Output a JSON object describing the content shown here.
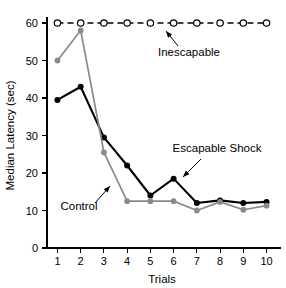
{
  "chart_data": {
    "type": "line",
    "title": "",
    "xlabel": "Trials",
    "ylabel": "Median Latency (sec)",
    "x": [
      1,
      2,
      3,
      4,
      5,
      6,
      7,
      8,
      9,
      10
    ],
    "xticklabels": [
      "1",
      "2",
      "3",
      "4",
      "5",
      "6",
      "7",
      "8",
      "9",
      "10"
    ],
    "yticklabels": [
      "0",
      "10",
      "20",
      "30",
      "40",
      "50",
      "60"
    ],
    "yticks": [
      0,
      10,
      20,
      30,
      40,
      50,
      60
    ],
    "xlim": [
      0.55,
      10.45
    ],
    "ylim": [
      0,
      63
    ],
    "grid": false,
    "legend": "inline-annotations",
    "series": [
      {
        "name": "Inescapable",
        "values": [
          60,
          60,
          60,
          60,
          60,
          60,
          60,
          60,
          60,
          60
        ],
        "color": "#000000",
        "linestyle": "dashed",
        "marker": "open-circle"
      },
      {
        "name": "Escapable Shock",
        "values": [
          39.5,
          43,
          29.5,
          22,
          14,
          18.5,
          12,
          12.7,
          12,
          12.3
        ],
        "color": "#000000",
        "linestyle": "solid",
        "marker": "filled-circle"
      },
      {
        "name": "Control",
        "values": [
          50,
          58,
          25.5,
          12.5,
          12.5,
          12.5,
          10,
          12.3,
          10.2,
          11.3
        ],
        "color": "#8a8a8a",
        "linestyle": "solid",
        "marker": "filled-circle"
      }
    ],
    "annotations": [
      {
        "text": "Inescapable",
        "target_series": "Inescapable"
      },
      {
        "text": "Escapable Shock",
        "target_series": "Escapable Shock"
      },
      {
        "text": "Control",
        "target_series": "Control"
      }
    ]
  }
}
